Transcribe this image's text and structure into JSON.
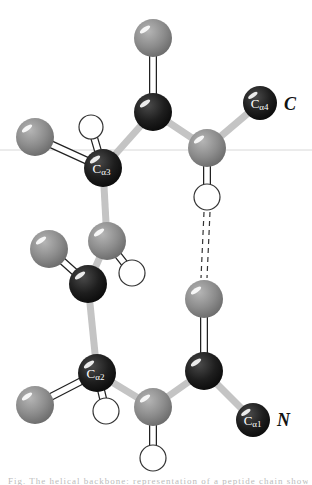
{
  "diagram": {
    "width": 312,
    "height": 485,
    "guide_line": {
      "y": 150,
      "color": "#d8d8d8"
    },
    "colors": {
      "carbon": "#1e1e1e",
      "heavy": "#8c8c8c",
      "hydrogen": "#ffffff",
      "bond_single": "#c4c4c4",
      "bond_double_stroke": "#222222",
      "hbond": "#333333",
      "label_text": "#ffffff",
      "terminus_text": "#111111"
    },
    "atoms": [
      {
        "id": "O_top",
        "type": "heavy",
        "x": 153,
        "y": 38,
        "r": 19
      },
      {
        "id": "C_top",
        "type": "carbon",
        "x": 153,
        "y": 112,
        "r": 19
      },
      {
        "id": "Ca4",
        "type": "carbon",
        "x": 260,
        "y": 103,
        "r": 17,
        "label": "Cα4"
      },
      {
        "id": "N_upper",
        "type": "heavy",
        "x": 207,
        "y": 148,
        "r": 19
      },
      {
        "id": "H_upper",
        "type": "hydrogen",
        "x": 207,
        "y": 197,
        "r": 13
      },
      {
        "id": "R3",
        "type": "heavy",
        "x": 35,
        "y": 137,
        "r": 19
      },
      {
        "id": "H3",
        "type": "hydrogen",
        "x": 91,
        "y": 127,
        "r": 12
      },
      {
        "id": "Ca3",
        "type": "carbon",
        "x": 103,
        "y": 168,
        "r": 19,
        "label": "Cα3"
      },
      {
        "id": "N_mid",
        "type": "heavy",
        "x": 107,
        "y": 241,
        "r": 19
      },
      {
        "id": "H_mid",
        "type": "hydrogen",
        "x": 132,
        "y": 273,
        "r": 13
      },
      {
        "id": "O_left",
        "type": "heavy",
        "x": 49,
        "y": 249,
        "r": 19
      },
      {
        "id": "C_mid",
        "type": "carbon",
        "x": 88,
        "y": 284,
        "r": 19
      },
      {
        "id": "O_right",
        "type": "heavy",
        "x": 204,
        "y": 299,
        "r": 19
      },
      {
        "id": "C_right",
        "type": "carbon",
        "x": 204,
        "y": 371,
        "r": 19
      },
      {
        "id": "Ca2",
        "type": "carbon",
        "x": 97,
        "y": 373,
        "r": 19,
        "label": "Cα2"
      },
      {
        "id": "R2",
        "type": "heavy",
        "x": 35,
        "y": 405,
        "r": 19
      },
      {
        "id": "H2",
        "type": "hydrogen",
        "x": 106,
        "y": 411,
        "r": 13
      },
      {
        "id": "N_low",
        "type": "heavy",
        "x": 153,
        "y": 407,
        "r": 19
      },
      {
        "id": "H_low",
        "type": "hydrogen",
        "x": 153,
        "y": 458,
        "r": 13
      },
      {
        "id": "Ca1",
        "type": "carbon",
        "x": 253,
        "y": 420,
        "r": 17,
        "label": "Cα1"
      }
    ],
    "bonds": [
      {
        "from": "O_top",
        "to": "C_top",
        "kind": "double"
      },
      {
        "from": "C_top",
        "to": "N_upper",
        "kind": "single"
      },
      {
        "from": "C_top",
        "to": "Ca3",
        "kind": "single"
      },
      {
        "from": "N_upper",
        "to": "Ca4",
        "kind": "single"
      },
      {
        "from": "N_upper",
        "to": "H_upper",
        "kind": "double"
      },
      {
        "from": "R3",
        "to": "Ca3",
        "kind": "double"
      },
      {
        "from": "H3",
        "to": "Ca3",
        "kind": "double"
      },
      {
        "from": "Ca3",
        "to": "N_mid",
        "kind": "single"
      },
      {
        "from": "N_mid",
        "to": "H_mid",
        "kind": "double"
      },
      {
        "from": "N_mid",
        "to": "C_mid",
        "kind": "single"
      },
      {
        "from": "O_left",
        "to": "C_mid",
        "kind": "double"
      },
      {
        "from": "C_mid",
        "to": "Ca2",
        "kind": "single"
      },
      {
        "from": "O_right",
        "to": "C_right",
        "kind": "double"
      },
      {
        "from": "Ca2",
        "to": "R2",
        "kind": "double"
      },
      {
        "from": "Ca2",
        "to": "H2",
        "kind": "double"
      },
      {
        "from": "Ca2",
        "to": "N_low",
        "kind": "single"
      },
      {
        "from": "N_low",
        "to": "C_right",
        "kind": "single"
      },
      {
        "from": "N_low",
        "to": "H_low",
        "kind": "double"
      },
      {
        "from": "C_right",
        "to": "Ca1",
        "kind": "single"
      }
    ],
    "hydrogen_bonds": [
      {
        "from": "H_upper",
        "to": "O_right"
      }
    ],
    "terminus_labels": [
      {
        "id": "C_terminus",
        "text": "C",
        "x": 284,
        "y": 110
      },
      {
        "id": "N_terminus",
        "text": "N",
        "x": 277,
        "y": 426
      }
    ]
  },
  "caption": {
    "text": "Fig. The helical backbone: representation of a peptide chain showing hydrogen bond"
  }
}
